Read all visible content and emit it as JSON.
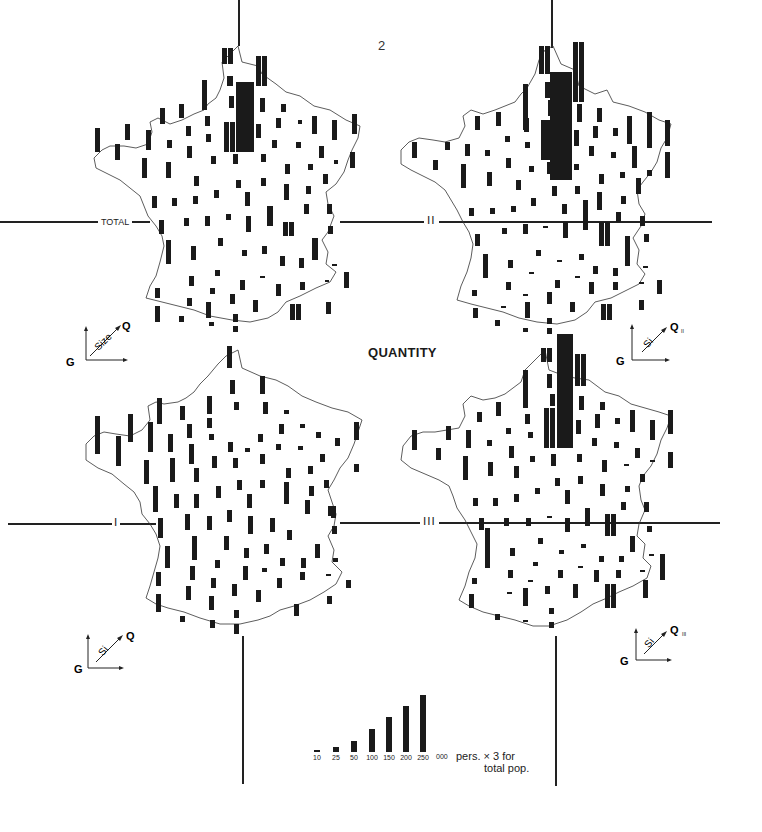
{
  "page": {
    "number": "2",
    "title": "QUANTITY"
  },
  "maps": [
    {
      "id": "total",
      "label": "TOTAL",
      "glyph": {
        "g": "G",
        "q": "Q",
        "diag": "Size",
        "sub": ""
      }
    },
    {
      "id": "ii",
      "label": "II",
      "glyph": {
        "g": "G",
        "q": "Q",
        "diag": "Si",
        "sub": "II"
      }
    },
    {
      "id": "i",
      "label": "I",
      "glyph": {
        "g": "G",
        "q": "Q",
        "diag": "Si",
        "sub": ""
      }
    },
    {
      "id": "iii",
      "label": "III",
      "glyph": {
        "g": "G",
        "q": "Q",
        "diag": "Si",
        "sub": "III"
      }
    }
  ],
  "legend": {
    "ticks": [
      "10",
      "25",
      "50",
      "100",
      "150",
      "200",
      "250"
    ],
    "values": [
      10,
      25,
      50,
      100,
      150,
      200,
      250
    ],
    "unit": "000",
    "note_line1": "pers. × 3 for",
    "note_line2": "total pop."
  },
  "colors": {
    "ink": "#1a1a1a",
    "paper": "#ffffff"
  }
}
